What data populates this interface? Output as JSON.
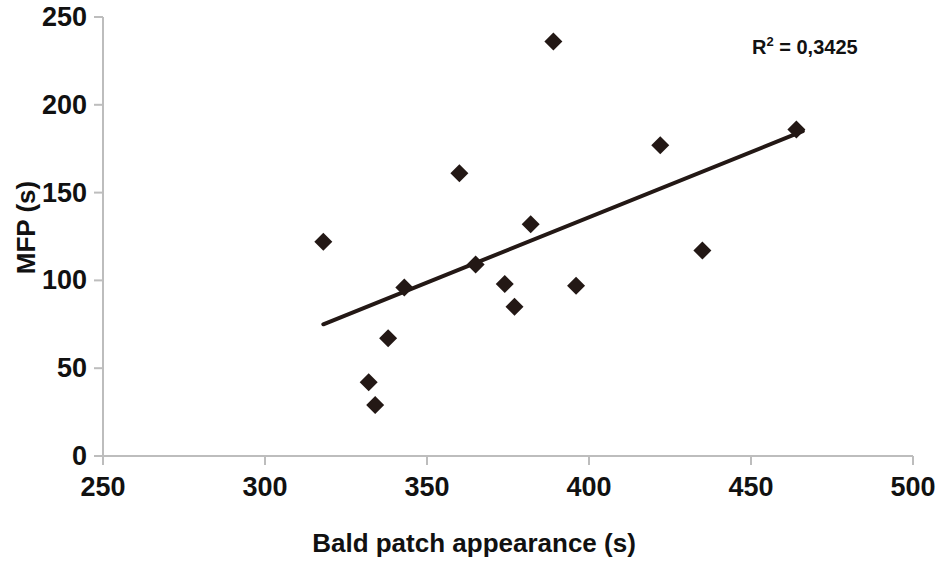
{
  "chart_data": {
    "type": "scatter",
    "title": "",
    "xlabel": "Bald patch appearance (s)",
    "ylabel": "MFP (s)",
    "xlim": [
      250,
      500
    ],
    "ylim": [
      0,
      250
    ],
    "xticks": [
      250,
      300,
      350,
      400,
      450,
      500
    ],
    "yticks": [
      0,
      50,
      100,
      150,
      200,
      250
    ],
    "grid": false,
    "legend": null,
    "marker": {
      "shape": "diamond",
      "color": "#231815",
      "size": 15
    },
    "points": [
      {
        "x": 318,
        "y": 122
      },
      {
        "x": 332,
        "y": 42
      },
      {
        "x": 334,
        "y": 29
      },
      {
        "x": 338,
        "y": 67
      },
      {
        "x": 343,
        "y": 96
      },
      {
        "x": 360,
        "y": 161
      },
      {
        "x": 365,
        "y": 109
      },
      {
        "x": 374,
        "y": 98
      },
      {
        "x": 377,
        "y": 85
      },
      {
        "x": 382,
        "y": 132
      },
      {
        "x": 389,
        "y": 236
      },
      {
        "x": 396,
        "y": 97
      },
      {
        "x": 422,
        "y": 177
      },
      {
        "x": 435,
        "y": 117
      },
      {
        "x": 464,
        "y": 186
      }
    ],
    "trendline": {
      "type": "linear",
      "x_start": 318,
      "y_start": 75,
      "x_end": 466,
      "y_end": 185,
      "color": "#231815",
      "width": 4
    },
    "annotations": [
      {
        "name": "r-squared",
        "text_prefix": "R",
        "superscript": "2",
        "text_suffix": " = 0,3425",
        "full_text": "R2 = 0,3425"
      }
    ]
  },
  "axes": {
    "x": {
      "label": "Bald patch appearance (s)",
      "tick_labels": [
        "250",
        "300",
        "350",
        "400",
        "450",
        "500"
      ]
    },
    "y": {
      "label": "MFP (s)",
      "tick_labels": [
        "250",
        "200",
        "150",
        "100",
        "50",
        "0"
      ]
    }
  },
  "annotation": {
    "r_squared_prefix": "R",
    "r_squared_sup": "2",
    "r_squared_value": " = 0,3425"
  },
  "colors": {
    "marker": "#231815",
    "trendline": "#231815",
    "axis": "#b9b9b9",
    "text": "#111111",
    "background": "#ffffff"
  }
}
